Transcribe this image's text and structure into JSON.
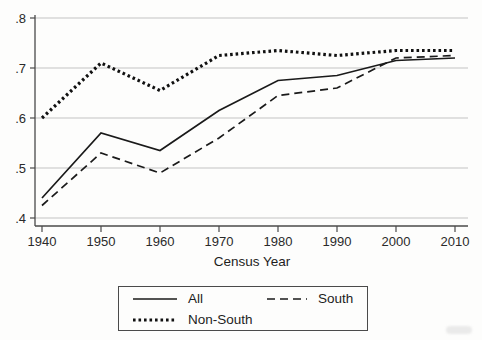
{
  "chart_data": {
    "type": "line",
    "title": "",
    "xlabel": "Census Year",
    "ylabel": "",
    "x": [
      1940,
      1950,
      1960,
      1970,
      1980,
      1990,
      2000,
      2010
    ],
    "x_tick_labels": [
      "1940",
      "1950",
      "1960",
      "1970",
      "1980",
      "1990",
      "2000",
      "2010"
    ],
    "y_ticks": [
      {
        "label": ".4",
        "value": 0.4
      },
      {
        "label": ".5",
        "value": 0.5
      },
      {
        "label": ".6",
        "value": 0.6
      },
      {
        "label": ".7",
        "value": 0.7
      },
      {
        "label": ".8",
        "value": 0.8
      }
    ],
    "ylim": [
      0.4,
      0.8
    ],
    "xlim": [
      1940,
      2010
    ],
    "grid": "horizontal",
    "legend_position": "bottom",
    "series": [
      {
        "name": "All",
        "style": "solid",
        "color": "#1a1a1a",
        "values": [
          0.44,
          0.57,
          0.535,
          0.615,
          0.675,
          0.685,
          0.715,
          0.72
        ]
      },
      {
        "name": "South",
        "style": "dashed",
        "color": "#1a1a1a",
        "values": [
          0.425,
          0.53,
          0.49,
          0.56,
          0.645,
          0.66,
          0.72,
          0.725
        ]
      },
      {
        "name": "Non-South",
        "style": "dotted",
        "color": "#111111",
        "values": [
          0.6,
          0.71,
          0.655,
          0.725,
          0.735,
          0.725,
          0.735,
          0.735
        ]
      }
    ]
  },
  "colors": {
    "gridline": "#c3c3c3",
    "axis": "#4a4a4a",
    "tick_text": "#2a2a2a"
  }
}
